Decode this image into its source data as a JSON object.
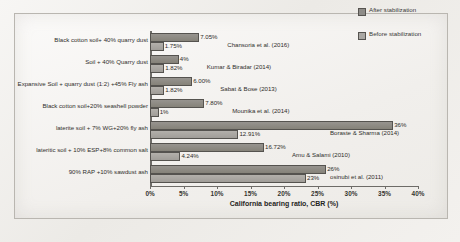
{
  "chart_data": {
    "type": "bar",
    "orientation": "horizontal",
    "title": "",
    "xlabel": "California bearing ratio, CBR (%)",
    "ylabel": "",
    "xlim": [
      0,
      40
    ],
    "xticks": [
      "0%",
      "5%",
      "10%",
      "15%",
      "20%",
      "25%",
      "30%",
      "35%",
      "40%"
    ],
    "grid": false,
    "legend_position": "top-right",
    "categories": [
      "Black cotton soil+ 40% quarry dust",
      "Soil + 40% Quarry dust",
      "Expansive Soil + quarry dust (1:2) +45% Fly ash",
      "Black cotton soil+20% seashell powder",
      "laterite soil + 7% WG+20% fly ash",
      "lateritic soil + 10% ESP+8% common salt",
      "90% RAP +10% sawdust ash"
    ],
    "series": [
      {
        "name": "After stabilization",
        "color": "#8e8c88",
        "values": [
          7.05,
          4,
          6.0,
          7.8,
          36,
          16.72,
          26
        ],
        "labels": [
          "7.05%",
          "4%",
          "6.00%",
          "7.80%",
          "36%",
          "16.72%",
          "26%"
        ]
      },
      {
        "name": "Before stabilization",
        "color": "#a9a7a3",
        "values": [
          1.75,
          1.82,
          1.82,
          1,
          12.91,
          4.24,
          23
        ],
        "labels": [
          "1.75%",
          "1.82%",
          "1.82%",
          "1%",
          "12.91%",
          "4.24%",
          "23%"
        ]
      }
    ],
    "annotations": [
      "Chansoria et al. (2016)",
      "Kumar & Biradar (2014)",
      "Sabat & Bose (2013)",
      "Mounika et al. (2014)",
      "Boraste & Sharma (2014)",
      "Amu & Salami (2010)",
      "osinubi et al. (2011)"
    ]
  },
  "legend": {
    "items": [
      {
        "label": "After stabilization"
      },
      {
        "label": "Before stabilization"
      }
    ]
  }
}
